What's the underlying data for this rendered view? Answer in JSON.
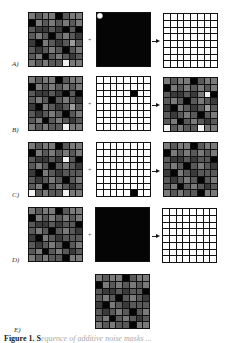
{
  "figure": {
    "rows": [
      {
        "label": "A)",
        "operator": "+",
        "left": "noise_a",
        "middle": "mask_a",
        "right": "result_a"
      },
      {
        "label": "B)",
        "operator": "+",
        "left": "noise_a",
        "middle": "mask_b",
        "right": "result_b"
      },
      {
        "label": "C)",
        "operator": "+",
        "left": "noise_c",
        "middle": "mask_c",
        "right": "result_c"
      },
      {
        "label": "D)",
        "operator": "+",
        "left": "noise_d",
        "middle": "mask_d",
        "right": "result_d"
      },
      {
        "label": "E)",
        "center": "result_e"
      }
    ],
    "grids": {
      "noise_a": [
        [
          3,
          2,
          3,
          3,
          0,
          2,
          3,
          3
        ],
        [
          0,
          3,
          2,
          3,
          2,
          3,
          2,
          3
        ],
        [
          2,
          1,
          1,
          2,
          1,
          0,
          2,
          0
        ],
        [
          2,
          3,
          2,
          0,
          2,
          3,
          2,
          1
        ],
        [
          1,
          0,
          3,
          2,
          1,
          2,
          4,
          2
        ],
        [
          2,
          1,
          2,
          3,
          2,
          0,
          2,
          3
        ],
        [
          2,
          3,
          0,
          2,
          3,
          2,
          1,
          2
        ],
        [
          3,
          2,
          3,
          2,
          2,
          5,
          3,
          3
        ]
      ],
      "mask_a": "black_with_white_corner",
      "result_a": "all_white",
      "mask_b": {
        "fill": "white",
        "black_cells": [
          [
            2,
            5
          ]
        ]
      },
      "result_b": [
        [
          3,
          2,
          3,
          3,
          0,
          2,
          3,
          3
        ],
        [
          0,
          3,
          2,
          3,
          2,
          3,
          2,
          3
        ],
        [
          2,
          1,
          1,
          2,
          1,
          3,
          5,
          0
        ],
        [
          2,
          3,
          2,
          0,
          2,
          3,
          2,
          1
        ],
        [
          1,
          0,
          3,
          2,
          1,
          2,
          4,
          2
        ],
        [
          2,
          1,
          2,
          3,
          2,
          0,
          2,
          3
        ],
        [
          2,
          3,
          0,
          2,
          3,
          2,
          1,
          2
        ],
        [
          5,
          2,
          3,
          2,
          2,
          5,
          3,
          3
        ]
      ],
      "noise_c": [
        [
          3,
          2,
          3,
          3,
          0,
          2,
          3,
          3
        ],
        [
          0,
          3,
          2,
          3,
          2,
          3,
          2,
          3
        ],
        [
          2,
          1,
          1,
          2,
          1,
          5,
          2,
          0
        ],
        [
          2,
          3,
          2,
          0,
          2,
          3,
          2,
          1
        ],
        [
          1,
          0,
          3,
          2,
          1,
          2,
          2,
          2
        ],
        [
          2,
          1,
          2,
          3,
          2,
          0,
          2,
          3
        ],
        [
          2,
          3,
          0,
          2,
          3,
          2,
          1,
          2
        ],
        [
          5,
          2,
          3,
          2,
          2,
          5,
          3,
          3
        ]
      ],
      "mask_c": {
        "fill": "white",
        "black_cells": [
          [
            7,
            5
          ]
        ]
      },
      "result_c": [
        [
          3,
          2,
          3,
          3,
          0,
          2,
          3,
          3
        ],
        [
          0,
          3,
          2,
          3,
          2,
          3,
          2,
          3
        ],
        [
          2,
          1,
          1,
          2,
          1,
          2,
          2,
          0
        ],
        [
          2,
          3,
          2,
          0,
          2,
          3,
          2,
          1
        ],
        [
          1,
          0,
          3,
          2,
          1,
          2,
          2,
          2
        ],
        [
          2,
          1,
          2,
          3,
          2,
          0,
          2,
          3
        ],
        [
          2,
          3,
          0,
          2,
          3,
          2,
          1,
          2
        ],
        [
          3,
          2,
          3,
          2,
          2,
          0,
          3,
          3
        ]
      ],
      "noise_d": [
        [
          3,
          2,
          3,
          3,
          0,
          2,
          3,
          3
        ],
        [
          0,
          3,
          2,
          3,
          2,
          3,
          2,
          3
        ],
        [
          2,
          1,
          1,
          2,
          1,
          2,
          2,
          0
        ],
        [
          2,
          3,
          2,
          0,
          2,
          3,
          2,
          1
        ],
        [
          1,
          0,
          3,
          2,
          1,
          2,
          2,
          2
        ],
        [
          2,
          1,
          2,
          3,
          2,
          0,
          2,
          3
        ],
        [
          2,
          3,
          0,
          2,
          3,
          2,
          1,
          2
        ],
        [
          3,
          2,
          3,
          2,
          2,
          0,
          3,
          3
        ]
      ],
      "mask_d": "all_black",
      "result_d": "all_white",
      "result_e": [
        [
          3,
          2,
          3,
          3,
          0,
          2,
          3,
          3
        ],
        [
          0,
          3,
          2,
          3,
          2,
          3,
          2,
          3
        ],
        [
          2,
          1,
          1,
          2,
          1,
          2,
          2,
          0
        ],
        [
          2,
          3,
          2,
          0,
          2,
          3,
          2,
          1
        ],
        [
          1,
          0,
          3,
          2,
          1,
          2,
          2,
          2
        ],
        [
          2,
          1,
          2,
          3,
          2,
          0,
          2,
          3
        ],
        [
          2,
          3,
          0,
          2,
          3,
          2,
          1,
          2
        ],
        [
          3,
          2,
          3,
          2,
          2,
          0,
          3,
          3
        ]
      ]
    },
    "shade_palette": [
      "#050505",
      "#3a3a3a",
      "#595959",
      "#7a7a7a",
      "#9a9a9a",
      "#f2f2f2"
    ],
    "caption": {
      "bold": "Figure 1. S",
      "faded": "equence of additive noise masks ..."
    }
  }
}
